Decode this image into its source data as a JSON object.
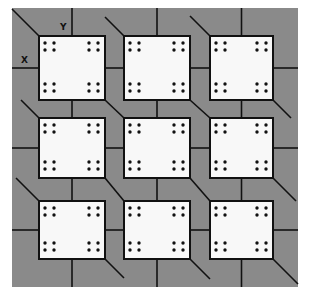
{
  "diagram": {
    "title": "",
    "background_color": "#ffffff",
    "substrate_color": "#8a8a8a",
    "cell_fill_color": "#f8f8f8",
    "line_color": "#111111",
    "substrate": {
      "x": 12,
      "y": 8,
      "width": 286,
      "height": 279
    },
    "axis_labels": {
      "x": {
        "text": "X",
        "left": 21,
        "top": 55
      },
      "y": {
        "text": "Y",
        "left": 60,
        "top": 22
      }
    },
    "grid": {
      "columns": [
        {
          "left": 39,
          "right": 105
        },
        {
          "left": 124,
          "right": 190
        },
        {
          "left": 210,
          "right": 273
        }
      ],
      "rows": [
        {
          "top": 36,
          "bottom": 100
        },
        {
          "top": 118,
          "bottom": 178
        },
        {
          "top": 201,
          "bottom": 259
        }
      ]
    },
    "cells": [
      {
        "id": "cell-1-1",
        "row": 0,
        "col": 0,
        "dot_groups": 4,
        "dots_per_group": 4
      },
      {
        "id": "cell-1-2",
        "row": 0,
        "col": 1,
        "dot_groups": 4,
        "dots_per_group": 4
      },
      {
        "id": "cell-1-3",
        "row": 0,
        "col": 2,
        "dot_groups": 4,
        "dots_per_group": 4
      },
      {
        "id": "cell-2-1",
        "row": 1,
        "col": 0,
        "dot_groups": 4,
        "dots_per_group": 4
      },
      {
        "id": "cell-2-2",
        "row": 1,
        "col": 1,
        "dot_groups": 4,
        "dots_per_group": 4
      },
      {
        "id": "cell-2-3",
        "row": 1,
        "col": 2,
        "dot_groups": 4,
        "dots_per_group": 4
      },
      {
        "id": "cell-3-1",
        "row": 2,
        "col": 0,
        "dot_groups": 4,
        "dots_per_group": 4
      },
      {
        "id": "cell-3-2",
        "row": 2,
        "col": 1,
        "dot_groups": 4,
        "dots_per_group": 4
      },
      {
        "id": "cell-3-3",
        "row": 2,
        "col": 2,
        "dot_groups": 4,
        "dots_per_group": 4
      }
    ]
  }
}
